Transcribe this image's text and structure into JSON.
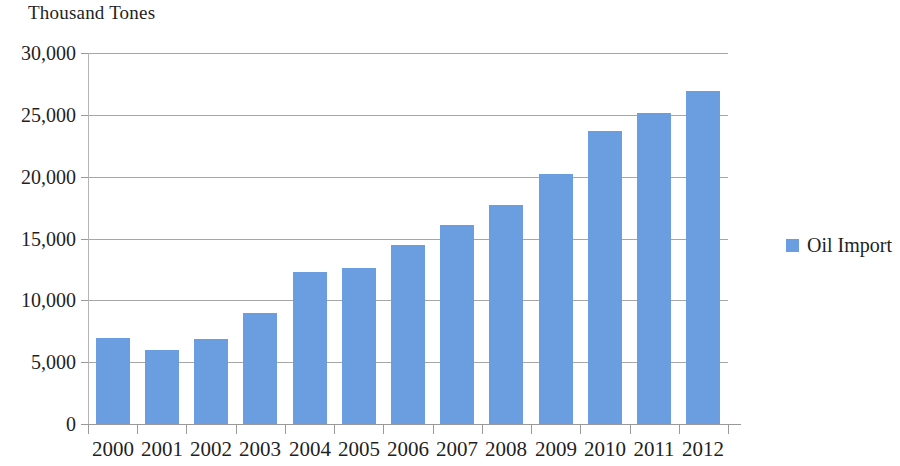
{
  "chart_data": {
    "type": "bar",
    "title": "Thousand Tones",
    "subtitle": "",
    "xlabel": "",
    "ylabel": "",
    "ylim": [
      0,
      30000
    ],
    "y_tick_labels": [
      "30,000",
      "25,000",
      "20,000",
      "15,000",
      "10,000",
      "5,000",
      "0"
    ],
    "y_tick_values": [
      30000,
      25000,
      20000,
      15000,
      10000,
      5000,
      0
    ],
    "grid": true,
    "legend_position": "right",
    "bar_color": "#6a9ee0",
    "categories": [
      "2000",
      "2001",
      "2002",
      "2003",
      "2004",
      "2005",
      "2006",
      "2007",
      "2008",
      "2009",
      "2010",
      "2011",
      "2012"
    ],
    "series": [
      {
        "name": "Oil Import",
        "color": "#6a9ee0",
        "values": [
          6950,
          6000,
          6870,
          8980,
          12280,
          12600,
          14450,
          16100,
          17700,
          20250,
          23700,
          25150,
          26900
        ]
      }
    ]
  },
  "legend": {
    "items": [
      {
        "label": "Oil Import",
        "color": "#6a9ee0"
      }
    ]
  }
}
